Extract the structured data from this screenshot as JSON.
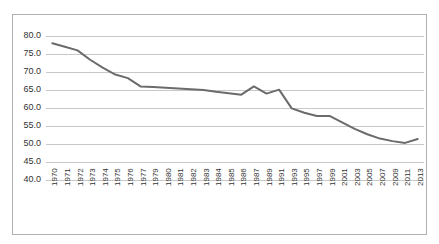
{
  "chart_data": {
    "type": "line",
    "title": "",
    "subtitle": "",
    "xlabel": "",
    "ylabel": "",
    "ylim": [
      40.0,
      80.0
    ],
    "ytick_step": 5.0,
    "ytick_labels": [
      "80.0",
      "75.0",
      "70.0",
      "65.0",
      "60.0",
      "55.0",
      "50.0",
      "45.0",
      "40.0"
    ],
    "ytick_values": [
      80.0,
      75.0,
      70.0,
      65.0,
      60.0,
      55.0,
      50.0,
      45.0,
      40.0
    ],
    "grid": true,
    "grid_axis": "y",
    "legend": false,
    "legend_position": "none",
    "line_color": "#6b6b6b",
    "grid_color": "#c8c8c8",
    "border_color": "#b0b0b0",
    "background_color": "#ffffff",
    "categories": [
      "1970",
      "1971",
      "1972",
      "1973",
      "1974",
      "1975",
      "1976",
      "1977",
      "1979",
      "1980",
      "1981",
      "1982",
      "1983",
      "1984",
      "1985",
      "1986",
      "1987",
      "1989",
      "1991",
      "1993",
      "1995",
      "1997",
      "1999",
      "2001",
      "2003",
      "2005",
      "2007",
      "2009",
      "2011",
      "2013"
    ],
    "values": [
      78.0,
      77.0,
      76.0,
      73.4,
      71.2,
      69.3,
      68.3,
      66.0,
      65.8,
      65.6,
      65.4,
      65.2,
      65.0,
      64.5,
      64.1,
      63.7,
      66.0,
      64.0,
      65.1,
      59.9,
      58.7,
      57.8,
      57.8,
      56.0,
      54.2,
      52.7,
      51.5,
      50.8,
      50.3,
      51.4
    ],
    "series": [
      {
        "name": "",
        "values": [
          78.0,
          77.0,
          76.0,
          73.4,
          71.2,
          69.3,
          68.3,
          66.0,
          65.8,
          65.6,
          65.4,
          65.2,
          65.0,
          64.5,
          64.1,
          63.7,
          66.0,
          64.0,
          65.1,
          59.9,
          58.7,
          57.8,
          57.8,
          56.0,
          54.2,
          52.7,
          51.5,
          50.8,
          50.3,
          51.4
        ]
      }
    ]
  }
}
